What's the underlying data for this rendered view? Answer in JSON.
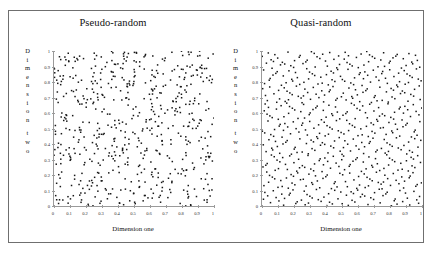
{
  "figure": {
    "background_color": "#ffffff",
    "frame_color": "#6f6f6f",
    "axis_color": "#9a9a9a",
    "dot_color": "#171717"
  },
  "panels": [
    {
      "id": "pseudo",
      "title": "Pseudo-random",
      "xlabel": "Dimension one",
      "ylabel": "Dimension two",
      "ylabel_letters": [
        "D",
        "i",
        "m",
        "e",
        "n",
        "s",
        "i",
        "o",
        "n",
        "",
        "t",
        "w",
        "o"
      ],
      "xticks": [
        "0",
        "0.1",
        "0.2",
        "0.3",
        "0.4",
        "0.5",
        "0.6",
        "0.7",
        "0.8",
        "0.9",
        "1"
      ],
      "yticks": [
        "1",
        "0.9",
        "0.8",
        "0.7",
        "0.6",
        "0.5",
        "0.4",
        "0.3",
        "0.2",
        "0.1",
        "0"
      ]
    },
    {
      "id": "quasi",
      "title": "Quasi-random",
      "xlabel": "Dimension one",
      "ylabel": "Dimension two",
      "ylabel_letters": [
        "D",
        "i",
        "m",
        "e",
        "n",
        "s",
        "i",
        "o",
        "n",
        "",
        "t",
        "w",
        "o"
      ],
      "xticks": [
        "0",
        "0.1",
        "0.2",
        "0.3",
        "0.4",
        "0.5",
        "0.6",
        "0.7",
        "0.8",
        "0.9",
        "1"
      ],
      "yticks": [
        "1",
        "0.9",
        "0.8",
        "0.7",
        "0.6",
        "0.5",
        "0.4",
        "0.3",
        "0.2",
        "0.1",
        "0"
      ]
    }
  ],
  "chart_data": [
    {
      "type": "scatter",
      "title": "Pseudo-random",
      "xlabel": "Dimension one",
      "ylabel": "Dimension two",
      "xlim": [
        0,
        1
      ],
      "ylim": [
        0,
        1
      ],
      "xticks": [
        0,
        0.1,
        0.2,
        0.3,
        0.4,
        0.5,
        0.6,
        0.7,
        0.8,
        0.9,
        1
      ],
      "yticks": [
        0,
        0.1,
        0.2,
        0.3,
        0.4,
        0.5,
        0.6,
        0.7,
        0.8,
        0.9,
        1
      ],
      "grid": false,
      "legend": null,
      "n_points": 600,
      "point_generator": "uniform-pseudo-random",
      "seed": 20240117,
      "description": "Uniform pseudo-random sample over the unit square showing visible clustering and empty gaps."
    },
    {
      "type": "scatter",
      "title": "Quasi-random",
      "xlabel": "Dimension one",
      "ylabel": "Dimension two",
      "xlim": [
        0,
        1
      ],
      "ylim": [
        0,
        1
      ],
      "xticks": [
        0,
        0.1,
        0.2,
        0.3,
        0.4,
        0.5,
        0.6,
        0.7,
        0.8,
        0.9,
        1
      ],
      "yticks": [
        0,
        0.1,
        0.2,
        0.3,
        0.4,
        0.5,
        0.6,
        0.7,
        0.8,
        0.9,
        1
      ],
      "grid": false,
      "legend": null,
      "n_points": 600,
      "point_generator": "halton-sequence-base-2-3",
      "description": "Low-discrepancy quasi-random (Halton) sample over the unit square filling space evenly with no large gaps."
    }
  ]
}
